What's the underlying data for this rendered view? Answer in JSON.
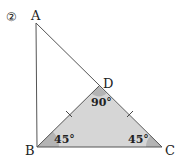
{
  "problem_number": "②",
  "points": {
    "A": {
      "label": "A",
      "x": 36,
      "y": 23
    },
    "B": {
      "label": "B",
      "x": 37,
      "y": 147
    },
    "C": {
      "label": "C",
      "x": 162,
      "y": 147
    },
    "D": {
      "label": "D",
      "x": 99,
      "y": 86
    }
  },
  "angles": {
    "B": "45°",
    "C": "45°",
    "D": "90°"
  },
  "equal_sides": [
    "BD",
    "DC"
  ],
  "colors": {
    "triangle_fill": "#d6d6d6",
    "angle_fill": "#b4b4b4",
    "stroke": "#555555"
  }
}
